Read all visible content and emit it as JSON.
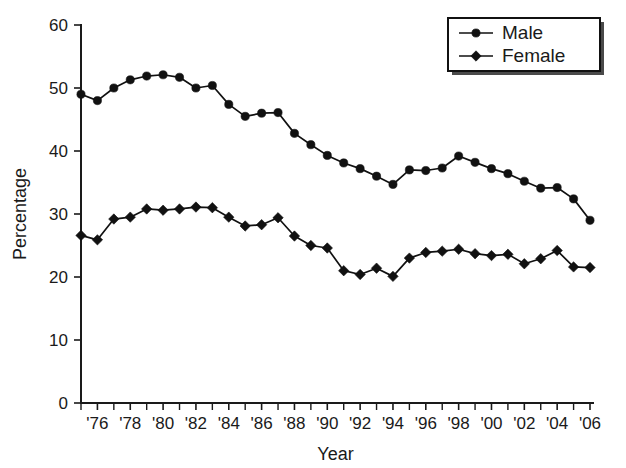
{
  "chart_data": {
    "type": "line",
    "title": "",
    "xlabel": "Year",
    "ylabel": "Percentage",
    "ylim": [
      0,
      60
    ],
    "ytick_values": [
      0,
      10,
      20,
      30,
      40,
      50,
      60
    ],
    "ytick_labels": [
      "0",
      "10",
      "20",
      "30",
      "40",
      "50",
      "60"
    ],
    "xlim": [
      1975,
      2006
    ],
    "x": [
      1975,
      1976,
      1977,
      1978,
      1979,
      1980,
      1981,
      1982,
      1983,
      1984,
      1985,
      1986,
      1987,
      1988,
      1989,
      1990,
      1991,
      1992,
      1993,
      1994,
      1995,
      1996,
      1997,
      1998,
      1999,
      2000,
      2001,
      2002,
      2003,
      2004,
      2005,
      2006
    ],
    "xtick_values": [
      1975,
      1976,
      1977,
      1978,
      1979,
      1980,
      1981,
      1982,
      1983,
      1984,
      1985,
      1986,
      1987,
      1988,
      1989,
      1990,
      1991,
      1992,
      1993,
      1994,
      1995,
      1996,
      1997,
      1998,
      1999,
      2000,
      2001,
      2002,
      2003,
      2004,
      2005,
      2006
    ],
    "xtick_labels": [
      "",
      "'76",
      "",
      "'78",
      "",
      "'80",
      "",
      "'82",
      "",
      "'84",
      "",
      "'86",
      "",
      "'88",
      "",
      "'90",
      "",
      "'92",
      "",
      "'94",
      "",
      "'96",
      "",
      "'98",
      "",
      "'00",
      "",
      "'02",
      "",
      "'04",
      "",
      "'06"
    ],
    "grid": false,
    "legend_position": "top-right",
    "series": [
      {
        "name": "Male",
        "marker": "circle",
        "values": [
          49.0,
          48.0,
          50.0,
          51.3,
          51.9,
          52.1,
          51.7,
          50.0,
          50.4,
          47.4,
          45.5,
          46.0,
          46.1,
          42.8,
          41.0,
          39.3,
          38.1,
          37.2,
          36.0,
          34.7,
          37.0,
          36.9,
          37.3,
          39.2,
          38.2,
          37.2,
          36.4,
          35.2,
          34.1,
          34.2,
          32.4,
          29.0
        ]
      },
      {
        "name": "Female",
        "marker": "diamond",
        "values": [
          26.6,
          25.9,
          29.2,
          29.5,
          30.8,
          30.6,
          30.8,
          31.1,
          31.0,
          29.5,
          28.1,
          28.3,
          29.4,
          26.5,
          25.0,
          24.6,
          21.0,
          20.4,
          21.4,
          20.1,
          23.0,
          23.9,
          24.1,
          24.4,
          23.7,
          23.4,
          23.6,
          22.1,
          22.9,
          24.2,
          21.6,
          21.5
        ]
      }
    ]
  },
  "legend": {
    "items": [
      {
        "label": "Male",
        "marker": "circle"
      },
      {
        "label": "Female",
        "marker": "diamond"
      }
    ]
  }
}
